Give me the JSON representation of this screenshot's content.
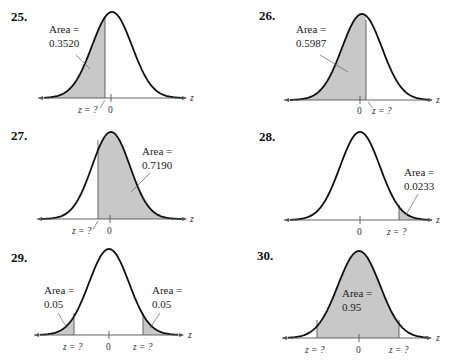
{
  "page": {
    "problems": [
      {
        "number": "25.",
        "area_label": [
          "Area =",
          "0.3520"
        ],
        "shade": "left",
        "tick_labels": {
          "zero": "0",
          "z": "z = ?"
        },
        "axis_var": "z"
      },
      {
        "number": "26.",
        "area_label": [
          "Area =",
          "0.5987"
        ],
        "shade": "left",
        "tick_labels": {
          "zero": "0",
          "z": "z = ?"
        },
        "axis_var": "z"
      },
      {
        "number": "27.",
        "area_label": [
          "Area =",
          "0.7190"
        ],
        "shade": "right",
        "tick_labels": {
          "zero": "0",
          "z": "z = ?"
        },
        "axis_var": "z"
      },
      {
        "number": "28.",
        "area_label": [
          "Area =",
          "0.0233"
        ],
        "shade": "right",
        "tick_labels": {
          "zero": "0",
          "z": "z = ?"
        },
        "axis_var": "z"
      },
      {
        "number": "29.",
        "area_label": [
          "Area =",
          "0.05"
        ],
        "area_label_right": [
          "Area =",
          "0.05"
        ],
        "shade": "two-tails",
        "tick_labels": {
          "zero": "0",
          "z_left": "z = ?",
          "z_right": "z = ?"
        },
        "axis_var": "z"
      },
      {
        "number": "30.",
        "area_label": [
          "Area =",
          "0.95"
        ],
        "shade": "middle",
        "tick_labels": {
          "zero": "0",
          "z_left": "z = ?",
          "z_right": "z = ?"
        },
        "axis_var": "z"
      }
    ]
  },
  "chart_data": [
    {
      "type": "area",
      "title": "25.",
      "distribution": "standard normal",
      "shaded_region": "left of z",
      "shaded_area": 0.352,
      "z_boundary_approx": -0.38,
      "xlabel": "z",
      "annotations": [
        "Area = 0.3520",
        "z = ?",
        "0"
      ]
    },
    {
      "type": "area",
      "title": "26.",
      "distribution": "standard normal",
      "shaded_region": "left of z",
      "shaded_area": 0.5987,
      "z_boundary_approx": 0.25,
      "xlabel": "z",
      "annotations": [
        "Area = 0.5987",
        "0",
        "z = ?"
      ]
    },
    {
      "type": "area",
      "title": "27.",
      "distribution": "standard normal",
      "shaded_region": "right of z",
      "shaded_area": 0.719,
      "z_boundary_approx": -0.58,
      "xlabel": "z",
      "annotations": [
        "Area = 0.7190",
        "z = ?",
        "0"
      ]
    },
    {
      "type": "area",
      "title": "28.",
      "distribution": "standard normal",
      "shaded_region": "right of z",
      "shaded_area": 0.0233,
      "z_boundary_approx": 1.99,
      "xlabel": "z",
      "annotations": [
        "Area = 0.0233",
        "0",
        "z = ?"
      ]
    },
    {
      "type": "area",
      "title": "29.",
      "distribution": "standard normal",
      "shaded_region": "both tails",
      "shaded_area_each_tail": 0.05,
      "z_boundary_approx": [
        -1.645,
        1.645
      ],
      "xlabel": "z",
      "annotations": [
        "Area = 0.05",
        "Area = 0.05",
        "z = ?",
        "0",
        "z = ?"
      ]
    },
    {
      "type": "area",
      "title": "30.",
      "distribution": "standard normal",
      "shaded_region": "between -z and z",
      "shaded_area": 0.95,
      "z_boundary_approx": [
        -1.96,
        1.96
      ],
      "xlabel": "z",
      "annotations": [
        "Area = 0.95",
        "z = ?",
        "0",
        "z = ?"
      ]
    }
  ]
}
